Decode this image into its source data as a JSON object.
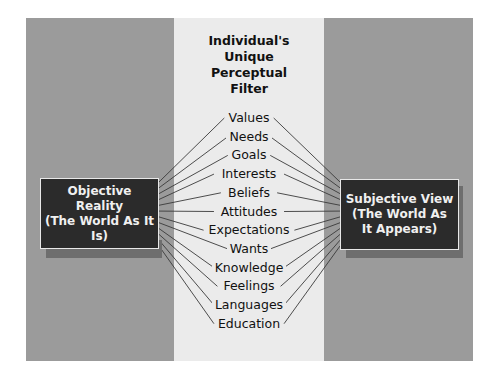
{
  "filter": {
    "title": "Individual's\nUnique\nPerceptual\nFilter"
  },
  "left_box": {
    "label": "Objective\nReality\n(The World As It Is)"
  },
  "right_box": {
    "label": "Subjective View\n(The World As\nIt Appears)"
  },
  "filters": [
    "Values",
    "Needs",
    "Goals",
    "Interests",
    "Beliefs",
    "Attitudes",
    "Expectations",
    "Wants",
    "Knowledge",
    "Feelings",
    "Languages",
    "Education"
  ],
  "colors": {
    "side_band": "#9b9b9b",
    "middle_band": "#ebebeb",
    "box_fill": "#2b2b2b",
    "box_text": "#f0f0f0",
    "line": "#333333"
  }
}
